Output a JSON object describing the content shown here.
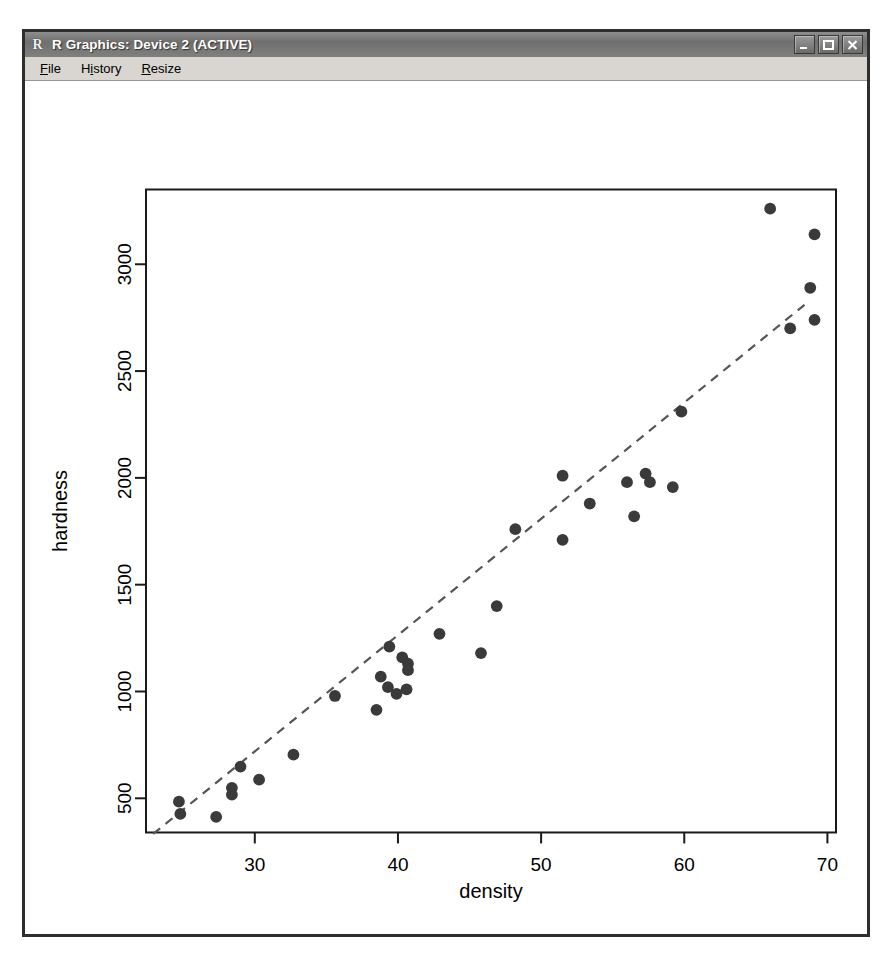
{
  "window": {
    "title": "R Graphics: Device 2 (ACTIVE)",
    "app_icon": "r-logo-icon",
    "buttons": {
      "minimize": "Minimize",
      "maximize": "Maximize",
      "close": "Close"
    }
  },
  "menubar": {
    "items": [
      {
        "label": "File",
        "accel": "F"
      },
      {
        "label": "History",
        "accel": "i"
      },
      {
        "label": "Resize",
        "accel": "R"
      }
    ]
  },
  "colors": {
    "titlebar_text": "#ffffff",
    "titlebar_bg": "#6f6f6f",
    "window_frame": "#2e2e2e",
    "menu_bg": "#d9d5d1",
    "canvas_bg": "#ffffff",
    "point_fill": "#3a3a3a",
    "line_color": "#555555",
    "axis_color": "#000000"
  },
  "chart_data": {
    "type": "scatter",
    "title": "",
    "xlabel": "density",
    "ylabel": "hardness",
    "xlim": [
      22.4,
      70.6
    ],
    "ylim": [
      340,
      3350
    ],
    "xticks": [
      30,
      40,
      50,
      60,
      70
    ],
    "yticks": [
      500,
      1000,
      1500,
      2000,
      2500,
      3000
    ],
    "grid": false,
    "legend": null,
    "point_symbol": "filled-circle",
    "point_size": 7,
    "x": [
      24.7,
      24.8,
      27.3,
      28.4,
      28.4,
      29.0,
      30.3,
      32.7,
      35.6,
      38.5,
      38.8,
      39.3,
      39.4,
      39.9,
      40.3,
      40.6,
      40.7,
      40.7,
      42.9,
      45.8,
      46.9,
      48.2,
      51.5,
      51.5,
      53.4,
      56.0,
      56.5,
      57.3,
      57.6,
      59.2,
      59.8,
      66.0,
      67.4,
      68.8,
      69.1,
      69.1
    ],
    "y": [
      484,
      427,
      413,
      517,
      549,
      648,
      587,
      704,
      979,
      914,
      1070,
      1020,
      1210,
      989,
      1160,
      1010,
      1100,
      1130,
      1270,
      1180,
      1400,
      1760,
      1710,
      2010,
      1880,
      1980,
      1820,
      2020,
      1980,
      1957,
      2310,
      3260,
      2700,
      2890,
      2740,
      3140
    ],
    "fit_line": {
      "style": "dashed",
      "x_start": 22.9,
      "x_end": 68.4,
      "y_start": 333,
      "y_end": 2810,
      "slope": 54.4,
      "intercept": -913
    }
  }
}
